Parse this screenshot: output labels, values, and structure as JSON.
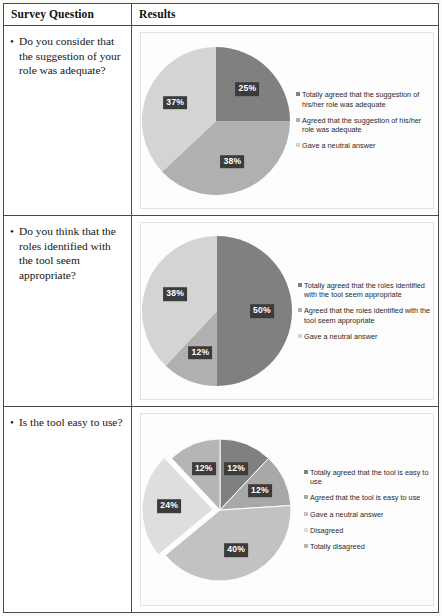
{
  "table": {
    "header": {
      "question_col": "Survey Question",
      "results_col": "Results"
    }
  },
  "colors": {
    "dark": "#808080",
    "medium": "#b0b0b0",
    "light": "#d4d4d4",
    "lighter": "#c9c9c9",
    "lightest": "#dedede",
    "label_bg": "#3b3b3b",
    "label_fg": "#ffffff",
    "border": "#4a4a4a",
    "plot_border": "#e2e2e2"
  },
  "rows": [
    {
      "question": "Do you consider that the suggestion of your role was adequate?",
      "chart_data": {
        "type": "pie",
        "title": "",
        "exploded": false,
        "categories": [
          "Totally agreed that the suggestion of his/her role was adequate",
          "Agreed that the suggestion of his/her role was adequate",
          "Gave a neutral answer"
        ],
        "values": [
          25,
          38,
          37
        ],
        "labels": [
          "25%",
          "38%",
          "37%"
        ],
        "colors": [
          "#808080",
          "#b0b0b0",
          "#d4d4d4"
        ],
        "legend_position": "right"
      }
    },
    {
      "question": "Do you think that the roles identified with the tool seem appropriate?",
      "chart_data": {
        "type": "pie",
        "title": "",
        "exploded": false,
        "categories": [
          "Totally agreed that the roles identified with the tool seem appropriate",
          "Agreed that the roles identified with the tool seem appropriate",
          "Gave a neutral answer"
        ],
        "values": [
          50,
          12,
          38
        ],
        "labels": [
          "50%",
          "12%",
          "38%"
        ],
        "colors": [
          "#808080",
          "#b0b0b0",
          "#d4d4d4"
        ],
        "legend_position": "right"
      }
    },
    {
      "question": "Is the tool easy to use?",
      "chart_data": {
        "type": "pie",
        "title": "",
        "exploded": true,
        "categories": [
          "Totally agreed that the tool is easy to use",
          "Agreed that the tool is easy to use",
          "Gave a neutral answer",
          "Disagreed",
          "Totally disagreed"
        ],
        "values": [
          12,
          12,
          40,
          24,
          12
        ],
        "labels": [
          "12%",
          "12%",
          "40%",
          "24%",
          "12%"
        ],
        "colors": [
          "#808080",
          "#a8a8a8",
          "#c2c2c2",
          "#dedede",
          "#b5b5b5"
        ],
        "legend_position": "right"
      }
    }
  ]
}
